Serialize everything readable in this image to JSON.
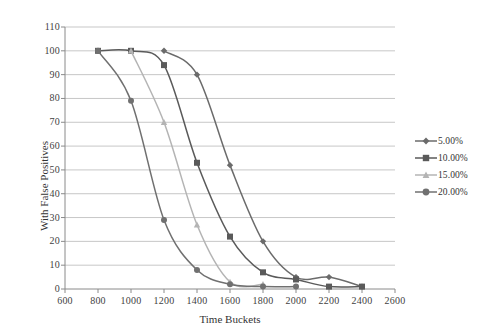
{
  "chart_data": {
    "type": "line",
    "title": "",
    "xlabel": "Time Buckets",
    "ylabel": "With False Positives",
    "xlim": [
      600,
      2600
    ],
    "ylim": [
      0,
      110
    ],
    "xticks": [
      600,
      800,
      1000,
      1200,
      1400,
      1600,
      1800,
      2000,
      2200,
      2400,
      2600
    ],
    "yticks": [
      0,
      10,
      20,
      30,
      40,
      50,
      60,
      70,
      80,
      90,
      100,
      110
    ],
    "grid": "horizontal",
    "legend_position": "right",
    "series": [
      {
        "name": "5.00%",
        "color": "#6b6b6b",
        "marker": "diamond",
        "x": [
          1200,
          1400,
          1600,
          1800,
          2000,
          2200,
          2400
        ],
        "values": [
          100,
          90,
          52,
          20,
          5,
          5,
          1
        ]
      },
      {
        "name": "10.00%",
        "color": "#5a5a5a",
        "marker": "square",
        "x": [
          800,
          1000,
          1200,
          1400,
          1600,
          1800,
          2000,
          2200,
          2400
        ],
        "values": [
          100,
          100,
          94,
          53,
          22,
          7,
          4,
          1,
          1
        ]
      },
      {
        "name": "15.00%",
        "color": "#b4b4b4",
        "marker": "triangle",
        "x": [
          1000,
          1200,
          1400,
          1600,
          1800
        ],
        "values": [
          100,
          70,
          27,
          3,
          2
        ]
      },
      {
        "name": "20.00%",
        "color": "#707070",
        "marker": "circle",
        "x": [
          800,
          1000,
          1200,
          1400,
          1600,
          1800,
          2000
        ],
        "values": [
          100,
          79,
          29,
          8,
          2,
          1,
          1
        ]
      }
    ]
  },
  "legend": {
    "items": [
      {
        "label": "5.00%"
      },
      {
        "label": "10.00%"
      },
      {
        "label": "15.00%"
      },
      {
        "label": "20.00%"
      }
    ]
  },
  "axes": {
    "x_title": "Time Buckets",
    "y_title": "With False Positives"
  }
}
